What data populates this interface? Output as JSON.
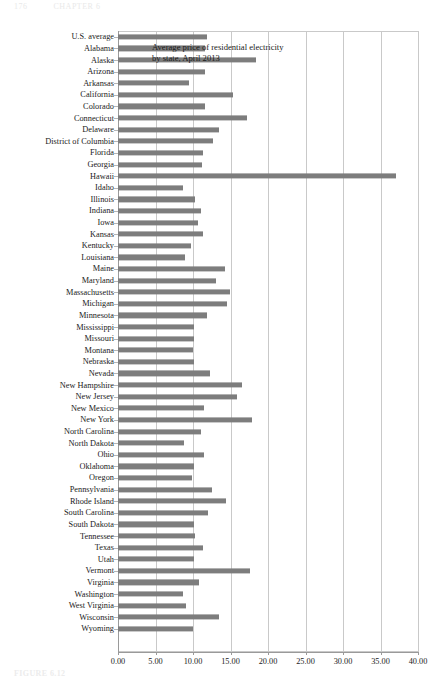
{
  "running_head": {
    "page_number": "176",
    "section_title": "CHAPTER 6"
  },
  "caption": {
    "label": "FIGURE 6.12"
  },
  "annotation": {
    "text": "Average price of residential electricity by state, April 2013"
  },
  "style": {
    "bar_color": "#7d7d7d",
    "gridline_color": "#c9c9c9",
    "axis_color": "#9a9a9a",
    "background": "#ffffff"
  },
  "chart_data": {
    "type": "bar",
    "orientation": "horizontal",
    "title": "",
    "annotation": "Average price of residential electricity by state, April 2013",
    "xlabel": "",
    "ylabel": "",
    "xlim": [
      0,
      40
    ],
    "grid": true,
    "legend": "none",
    "unit": "cents per kilowatt-hour",
    "xticks": [
      "0.00",
      "5.00",
      "10.00",
      "15.00",
      "20.00",
      "25.00",
      "30.00",
      "35.00",
      "40.00"
    ],
    "xtick_values": [
      0,
      5,
      10,
      15,
      20,
      25,
      30,
      35,
      40
    ],
    "categories": [
      "U.S. average",
      "Alabama",
      "Alaska",
      "Arizona",
      "Arkansas",
      "California",
      "Colorado",
      "Connecticut",
      "Delaware",
      "District of Columbia",
      "Florida",
      "Georgia",
      "Hawaii",
      "Idaho",
      "Illinois",
      "Indiana",
      "Iowa",
      "Kansas",
      "Kentucky",
      "Louisiana",
      "Maine",
      "Maryland",
      "Massachusetts",
      "Michigan",
      "Minnesota",
      "Mississippi",
      "Missouri",
      "Montana",
      "Nebraska",
      "Nevada",
      "New Hampshire",
      "New Jersey",
      "New Mexico",
      "New York",
      "North Carolina",
      "North Dakota",
      "Ohio",
      "Oklahoma",
      "Oregon",
      "Pennsylvania",
      "Rhode Island",
      "South Carolina",
      "South Dakota",
      "Tennessee",
      "Texas",
      "Utah",
      "Vermont",
      "Virginia",
      "Washington",
      "West Virginia",
      "Wisconsin",
      "Wyoming"
    ],
    "values": [
      11.88,
      11.55,
      18.36,
      11.64,
      9.42,
      15.34,
      11.62,
      17.24,
      13.52,
      12.62,
      11.36,
      11.24,
      37.04,
      8.72,
      10.32,
      11.02,
      10.72,
      11.28,
      9.78,
      8.92,
      14.22,
      13.02,
      14.92,
      14.52,
      11.82,
      10.18,
      10.08,
      10.02,
      10.18,
      12.28,
      16.52,
      15.82,
      11.52,
      17.82,
      11.08,
      8.86,
      11.44,
      10.14,
      9.84,
      12.54,
      14.44,
      12.04,
      10.18,
      10.28,
      11.34,
      10.14,
      17.62,
      10.82,
      8.62,
      9.12,
      13.52,
      10.02
    ]
  }
}
